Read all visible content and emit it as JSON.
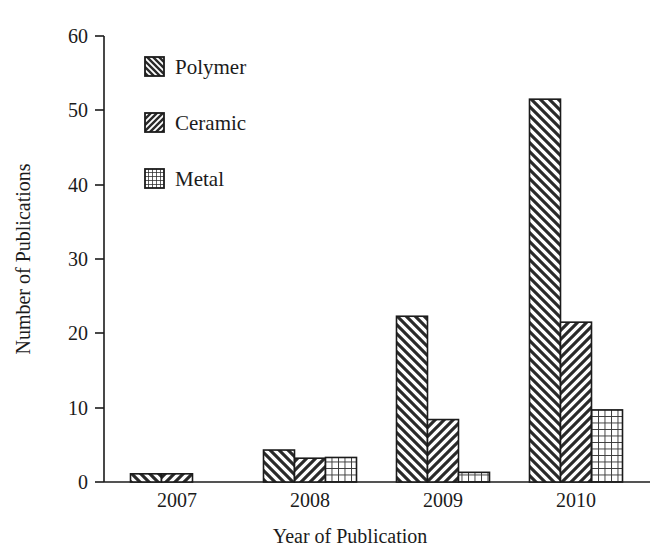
{
  "chart_data": {
    "type": "bar",
    "title": "",
    "subtitle": "",
    "xlabel": "Year of Publication",
    "ylabel": "Number of Publications",
    "categories": [
      "2007",
      "2008",
      "2009",
      "2010"
    ],
    "series": [
      {
        "name": "Polymer",
        "values": [
          1.1,
          4.3,
          22.3,
          51.5
        ],
        "pattern": "diagonal-backslash-hatch",
        "color": "#ffffff",
        "edge_color": "#1b1b1b"
      },
      {
        "name": "Ceramic",
        "values": [
          1.1,
          3.2,
          8.4,
          21.5
        ],
        "pattern": "diagonal-forwardslash-hatch",
        "color": "#ffffff",
        "edge_color": "#1b1b1b"
      },
      {
        "name": "Metal",
        "values": [
          0,
          3.3,
          1.3,
          9.7
        ],
        "pattern": "crosshatch-grid",
        "color": "#ffffff",
        "edge_color": "#1b1b1b"
      }
    ],
    "ylim": [
      0,
      60
    ],
    "yticks": [
      0,
      10,
      20,
      30,
      40,
      50,
      60
    ],
    "ytick_labels": [
      "0",
      "10",
      "20",
      "30",
      "40",
      "50",
      "60"
    ],
    "xtick_labels": [
      "2007",
      "2008",
      "2009",
      "2010"
    ],
    "grid": false,
    "legend_position": "upper-left-inside",
    "legend_entries": [
      "Polymer",
      "Ceramic",
      "Metal"
    ]
  },
  "axis": {
    "y_title": "Number of Publications",
    "x_title": "Year of Publication"
  },
  "legend": {
    "items": [
      {
        "label": "Polymer",
        "swatch": "diagonal-backslash-hatch-icon"
      },
      {
        "label": "Ceramic",
        "swatch": "diagonal-forwardslash-hatch-icon"
      },
      {
        "label": "Metal",
        "swatch": "crosshatch-grid-icon"
      }
    ]
  },
  "colors": {
    "ink": "#1b1b1b",
    "background": "#ffffff"
  }
}
